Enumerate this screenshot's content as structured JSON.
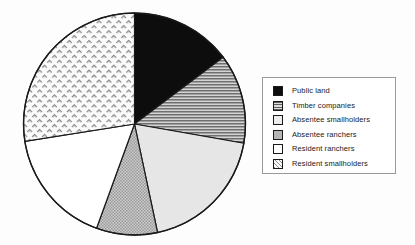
{
  "chart_data": {
    "type": "pie",
    "title": "",
    "subtitle": "",
    "xlabel": "",
    "ylabel": "",
    "legend_position": "right",
    "grid": false,
    "start_angle_deg": 0,
    "direction": "clockwise",
    "categories": [
      "Public land",
      "Timber companies",
      "Absentee smallholders",
      "Absentee ranchers",
      "Resident ranchers",
      "Resident smallholders"
    ],
    "values": [
      14.7,
      13.1,
      18.9,
      8.9,
      16.9,
      27.5
    ],
    "slices": [
      {
        "label": "Public land",
        "value": 14.7,
        "start_deg": 0,
        "end_deg": 53,
        "sweep_deg": 53,
        "fill": "#0d0d0d",
        "pattern": "solid-black",
        "swatch": "solid-black"
      },
      {
        "label": "Timber companies",
        "value": 13.1,
        "start_deg": 53,
        "end_deg": 100,
        "sweep_deg": 47,
        "fill": "#b9b9b9",
        "pattern": "horizontal-lines",
        "swatch": "horizontal-lines"
      },
      {
        "label": "Absentee smallholders",
        "value": 18.9,
        "start_deg": 100,
        "end_deg": 168,
        "sweep_deg": 68,
        "fill": "#e3e3e3",
        "pattern": "very-light-solid",
        "swatch": "very-light-solid"
      },
      {
        "label": "Absentee ranchers",
        "value": 8.9,
        "start_deg": 168,
        "end_deg": 200,
        "sweep_deg": 32,
        "fill": "#bdbdbd",
        "pattern": "medium-gray-dots",
        "swatch": "medium-gray-dots"
      },
      {
        "label": "Resident ranchers",
        "value": 16.9,
        "start_deg": 200,
        "end_deg": 261,
        "sweep_deg": 61,
        "fill": "#ffffff",
        "pattern": "white-solid",
        "swatch": "white-solid"
      },
      {
        "label": "Resident smallholders",
        "value": 27.5,
        "start_deg": 261,
        "end_deg": 360,
        "sweep_deg": 99,
        "fill": "#f2f2f2",
        "pattern": "crosshatch-dashes",
        "swatch": "crosshatch-dashes"
      }
    ],
    "geometry": {
      "center_x": 134.5,
      "center_y": 124,
      "radius": 111,
      "outline_color": "#1a1a1a"
    }
  },
  "legend": {
    "border_color": "#9a9a9a",
    "items": [
      {
        "label": "Public land"
      },
      {
        "label": "Timber companies"
      },
      {
        "label": "Absentee smallholders"
      },
      {
        "label": "Absentee ranchers"
      },
      {
        "label": "Resident ranchers"
      },
      {
        "label": "Resident smallholders"
      }
    ]
  },
  "colors": {
    "outline": "#1a1a1a",
    "black_slice": "#0d0d0d",
    "stripe_slice": "#b9b9b9",
    "light_slice": "#e3e3e3",
    "gray_slice": "#bdbdbd",
    "white_slice": "#ffffff",
    "hatch_slice": "#f2f2f2",
    "background": "#fdfdfd"
  }
}
